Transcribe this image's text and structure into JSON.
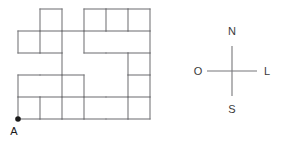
{
  "figure": {
    "type": "grid-path-diagram",
    "background_color": "#ffffff",
    "line_color": "#77777a",
    "label_color": "#3a3a3a",
    "dot_color": "#1a1a1a",
    "grid": {
      "origin_x": 18,
      "origin_y": 9,
      "cell_width": 22,
      "cell_height": 22,
      "columns": 6,
      "rows": 5,
      "x_ticks": [
        18,
        40,
        62,
        84,
        106,
        128,
        150
      ],
      "y_ticks": [
        9,
        31,
        53,
        75,
        97,
        119
      ]
    },
    "horizontal_segments": [
      {
        "row": 0,
        "x1": 40,
        "x2": 62,
        "y": 9
      },
      {
        "row": 0,
        "x1": 84,
        "x2": 106,
        "y": 9
      },
      {
        "row": 0,
        "x1": 106,
        "x2": 128,
        "y": 9
      },
      {
        "row": 0,
        "x1": 128,
        "x2": 150,
        "y": 9
      },
      {
        "row": 1,
        "x1": 18,
        "x2": 40,
        "y": 31
      },
      {
        "row": 1,
        "x1": 40,
        "x2": 62,
        "y": 31
      },
      {
        "row": 1,
        "x1": 62,
        "x2": 84,
        "y": 31
      },
      {
        "row": 1,
        "x1": 84,
        "x2": 106,
        "y": 31
      },
      {
        "row": 1,
        "x1": 106,
        "x2": 128,
        "y": 31
      },
      {
        "row": 1,
        "x1": 128,
        "x2": 150,
        "y": 31
      },
      {
        "row": 2,
        "x1": 18,
        "x2": 40,
        "y": 53
      },
      {
        "row": 2,
        "x1": 40,
        "x2": 62,
        "y": 53
      },
      {
        "row": 2,
        "x1": 84,
        "x2": 106,
        "y": 53
      },
      {
        "row": 2,
        "x1": 106,
        "x2": 128,
        "y": 53
      },
      {
        "row": 2,
        "x1": 128,
        "x2": 150,
        "y": 53
      },
      {
        "row": 3,
        "x1": 18,
        "x2": 40,
        "y": 75
      },
      {
        "row": 3,
        "x1": 40,
        "x2": 62,
        "y": 75
      },
      {
        "row": 3,
        "x1": 62,
        "x2": 84,
        "y": 75
      },
      {
        "row": 3,
        "x1": 128,
        "x2": 150,
        "y": 75
      },
      {
        "row": 4,
        "x1": 18,
        "x2": 40,
        "y": 97
      },
      {
        "row": 4,
        "x1": 40,
        "x2": 62,
        "y": 97
      },
      {
        "row": 4,
        "x1": 62,
        "x2": 84,
        "y": 97
      },
      {
        "row": 4,
        "x1": 84,
        "x2": 106,
        "y": 97
      },
      {
        "row": 4,
        "x1": 106,
        "x2": 128,
        "y": 97
      },
      {
        "row": 4,
        "x1": 128,
        "x2": 150,
        "y": 97
      },
      {
        "row": 5,
        "x1": 18,
        "x2": 40,
        "y": 119
      },
      {
        "row": 5,
        "x1": 40,
        "x2": 62,
        "y": 119
      },
      {
        "row": 5,
        "x1": 62,
        "x2": 84,
        "y": 119
      },
      {
        "row": 5,
        "x1": 84,
        "x2": 106,
        "y": 119
      },
      {
        "row": 5,
        "x1": 106,
        "x2": 128,
        "y": 119
      },
      {
        "row": 5,
        "x1": 128,
        "x2": 150,
        "y": 119
      }
    ],
    "vertical_segments": [
      {
        "col": 0,
        "y1": 31,
        "y2": 53,
        "x": 18
      },
      {
        "col": 0,
        "y1": 75,
        "y2": 97,
        "x": 18
      },
      {
        "col": 0,
        "y1": 97,
        "y2": 119,
        "x": 18
      },
      {
        "col": 1,
        "y1": 9,
        "y2": 31,
        "x": 40
      },
      {
        "col": 1,
        "y1": 31,
        "y2": 53,
        "x": 40
      },
      {
        "col": 1,
        "y1": 97,
        "y2": 119,
        "x": 40
      },
      {
        "col": 2,
        "y1": 9,
        "y2": 31,
        "x": 62
      },
      {
        "col": 2,
        "y1": 31,
        "y2": 53,
        "x": 62
      },
      {
        "col": 2,
        "y1": 53,
        "y2": 75,
        "x": 62
      },
      {
        "col": 2,
        "y1": 75,
        "y2": 97,
        "x": 62
      },
      {
        "col": 2,
        "y1": 97,
        "y2": 119,
        "x": 62
      },
      {
        "col": 3,
        "y1": 9,
        "y2": 31,
        "x": 84
      },
      {
        "col": 3,
        "y1": 31,
        "y2": 53,
        "x": 84
      },
      {
        "col": 3,
        "y1": 75,
        "y2": 97,
        "x": 84
      },
      {
        "col": 3,
        "y1": 97,
        "y2": 119,
        "x": 84
      },
      {
        "col": 4,
        "y1": 9,
        "y2": 31,
        "x": 106
      },
      {
        "col": 5,
        "y1": 9,
        "y2": 31,
        "x": 128
      },
      {
        "col": 5,
        "y1": 53,
        "y2": 75,
        "x": 128
      },
      {
        "col": 5,
        "y1": 75,
        "y2": 97,
        "x": 128
      },
      {
        "col": 5,
        "y1": 97,
        "y2": 119,
        "x": 128
      },
      {
        "col": 6,
        "y1": 9,
        "y2": 31,
        "x": 150
      },
      {
        "col": 6,
        "y1": 31,
        "y2": 53,
        "x": 150
      },
      {
        "col": 6,
        "y1": 53,
        "y2": 75,
        "x": 150
      },
      {
        "col": 6,
        "y1": 75,
        "y2": 97,
        "x": 150
      },
      {
        "col": 6,
        "y1": 97,
        "y2": 119,
        "x": 150
      }
    ],
    "point": {
      "label": "A",
      "x": 18,
      "y": 119,
      "radius": 2.8,
      "label_x": 14,
      "label_y": 135
    }
  },
  "compass": {
    "center_x": 232,
    "center_y": 71,
    "arm_length": 25,
    "north": {
      "label": "N",
      "x": 232,
      "y": 35
    },
    "south": {
      "label": "S",
      "x": 232,
      "y": 113
    },
    "west": {
      "label": "O",
      "x": 198,
      "y": 75
    },
    "east": {
      "label": "L",
      "x": 267,
      "y": 75
    }
  }
}
